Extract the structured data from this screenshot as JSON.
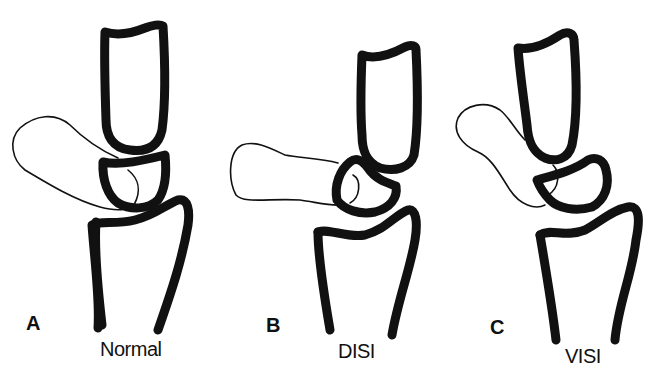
{
  "figure": {
    "panels": [
      {
        "letter": "A",
        "caption": "Normal"
      },
      {
        "letter": "B",
        "caption": "DISI"
      },
      {
        "letter": "C",
        "caption": "VISI"
      }
    ],
    "structures": [
      "capitate",
      "lunate",
      "scaphoid",
      "radius"
    ],
    "colors": {
      "line": "#111111",
      "background": "#ffffff"
    }
  }
}
